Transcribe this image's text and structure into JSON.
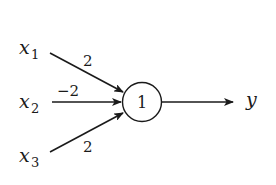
{
  "diagram": {
    "type": "perceptron / threshold neuron",
    "inputs": [
      {
        "var": "x",
        "sub": "1",
        "weight": "2"
      },
      {
        "var": "x",
        "sub": "2",
        "weight": "−2"
      },
      {
        "var": "x",
        "sub": "3",
        "weight": "2"
      }
    ],
    "neuron": {
      "threshold": "1"
    },
    "output": {
      "label": "y"
    },
    "colors": {
      "ink": "#1a1a1a",
      "background": "#ffffff"
    }
  }
}
